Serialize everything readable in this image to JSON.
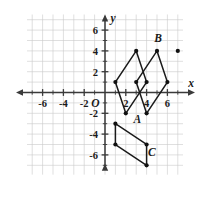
{
  "figure": {
    "axis_labels": {
      "x": "x",
      "y": "y",
      "origin": "O"
    },
    "colors": {
      "grid": "#c9c9c9",
      "axis": "#3a3a3a",
      "shape_stroke": "#1a1a1a",
      "vertex_fill": "#111111",
      "background": "#ffffff"
    },
    "x_ticks": [
      "-6",
      "-4",
      "-2",
      "2",
      "4",
      "6"
    ],
    "y_ticks": [
      "6",
      "4",
      "2",
      "-2",
      "-4",
      "-6"
    ],
    "x_range": [
      -8,
      8
    ],
    "y_range": [
      -8,
      8
    ],
    "grid_step": 1,
    "tick_step": 2
  },
  "chart_data": {
    "type": "scatter",
    "xlabel": "x",
    "ylabel": "y",
    "xlim": [
      -8,
      8
    ],
    "ylim": [
      -8,
      8
    ],
    "grid": true,
    "shapes": [
      {
        "name": "parallelogram-A",
        "label": "A",
        "label_point": [
          3.1,
          -2.9
        ],
        "vertices": [
          [
            2,
            -2
          ],
          [
            1,
            1
          ],
          [
            3,
            4
          ],
          [
            4,
            1
          ]
        ],
        "closed": true
      },
      {
        "name": "parallelogram-B",
        "label": "B",
        "label_point": [
          5.1,
          4.9
        ],
        "vertices": [
          [
            4,
            -2
          ],
          [
            3,
            1
          ],
          [
            5,
            4
          ],
          [
            6,
            1
          ]
        ],
        "closed": true
      },
      {
        "name": "parallelogram-C",
        "label": "C",
        "label_point": [
          4.5,
          -6.1
        ],
        "vertices": [
          [
            1,
            -3
          ],
          [
            1,
            -5
          ],
          [
            4,
            -7
          ],
          [
            4,
            -5
          ]
        ],
        "closed": true
      }
    ],
    "points": [
      [
        2,
        -2
      ],
      [
        4,
        -2
      ],
      [
        1,
        1
      ],
      [
        3,
        1
      ],
      [
        4,
        1
      ],
      [
        6,
        1
      ],
      [
        3,
        4
      ],
      [
        5,
        4
      ],
      [
        7,
        4
      ],
      [
        1,
        -3
      ],
      [
        1,
        -5
      ],
      [
        4,
        -5
      ],
      [
        4,
        -7
      ]
    ]
  }
}
